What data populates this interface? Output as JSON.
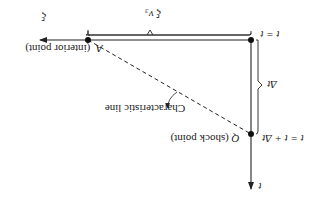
{
  "orientation": "rotated-180",
  "diagram": {
    "axes": {
      "xi_label": "ξ",
      "t_label": "t"
    },
    "points": {
      "corner": {
        "label": "t = t"
      },
      "A": {
        "letter": "A",
        "description": "(interior point)"
      },
      "Q": {
        "letter": "Q",
        "description": "(shock point)",
        "time_label": "t = t + Δt"
      }
    },
    "brackets": {
      "horizontal": {
        "label": "ξ v₃"
      },
      "vertical": {
        "label": "Δt"
      }
    },
    "characteristic_line": {
      "label": "Characteristic line"
    }
  },
  "colors": {
    "ink": "#222222",
    "background": "#ffffff"
  }
}
